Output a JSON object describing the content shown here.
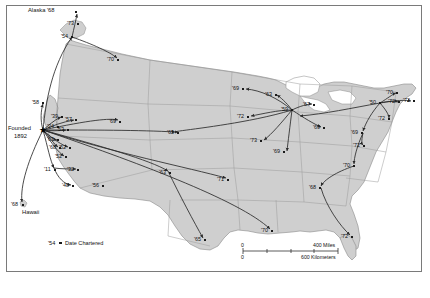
{
  "figure": {
    "type": "map",
    "title": "",
    "frame": {
      "border_color": "#7a7a7a",
      "background": "#ffffff"
    },
    "land_fill": "#cfcfcf",
    "state_border": "#9a9a9a",
    "coast_color": "#8a8a8a",
    "route_color": "#2b2b2b"
  },
  "legend": {
    "sample_year": "'54",
    "marker": "●",
    "label": "Date Chartered"
  },
  "scale_bar": {
    "miles": {
      "zero": "0",
      "max": "400 Miles"
    },
    "kilometers": {
      "zero": "0",
      "max": "600 Kilometers"
    }
  },
  "origin": {
    "name_line1": "Founded",
    "name_line2": "1892",
    "marker": "★"
  },
  "place_labels": [
    {
      "text": "Alaska '68"
    },
    {
      "text": "Hawaii"
    }
  ],
  "chart_data": {
    "type": "map",
    "title": "Date Chartered",
    "value_label": "Date Chartered",
    "series_name": "chapters",
    "points": [
      {
        "label": "Alaska '68",
        "year": "'68",
        "x": 76,
        "y": 12,
        "region": "Alaska"
      },
      {
        "label": "'73",
        "year": "'73",
        "x": 78,
        "y": 24,
        "region": "Washington-north"
      },
      {
        "label": "'54",
        "year": "'54",
        "x": 72,
        "y": 37,
        "region": "Washington"
      },
      {
        "label": "'70",
        "year": "'70",
        "x": 118,
        "y": 60,
        "region": "Montana"
      },
      {
        "label": "'58",
        "year": "'58",
        "x": 43,
        "y": 103,
        "region": "Northern-California"
      },
      {
        "label": "'39",
        "year": "'39",
        "x": 62,
        "y": 117,
        "region": "Bay-Area"
      },
      {
        "label": "'57",
        "year": "'57",
        "x": 76,
        "y": 120,
        "region": "Nevada"
      },
      {
        "label": "'24",
        "year": "'24",
        "x": 58,
        "y": 127,
        "region": "Bay-Area-2"
      },
      {
        "label": "'53",
        "year": "'53",
        "x": 68,
        "y": 130,
        "region": "Central-California"
      },
      {
        "label": "'63",
        "year": "'63",
        "x": 58,
        "y": 140,
        "region": "California-coast"
      },
      {
        "label": "'68",
        "year": "'68",
        "x": 60,
        "y": 148,
        "region": "California-coast-2"
      },
      {
        "label": "'52",
        "year": "'52",
        "x": 70,
        "y": 148,
        "region": "Southern-California"
      },
      {
        "label": "'52",
        "year": "'52",
        "x": 66,
        "y": 157,
        "region": "Southern-California-2"
      },
      {
        "label": "'11",
        "year": "'11",
        "x": 55,
        "y": 170,
        "region": "Los-Angeles"
      },
      {
        "label": "'32",
        "year": "'32",
        "x": 78,
        "y": 170,
        "region": "Los-Angeles-2"
      },
      {
        "label": "'48",
        "year": "'48",
        "x": 73,
        "y": 186,
        "region": "San-Diego"
      },
      {
        "label": "'56",
        "year": "'56",
        "x": 103,
        "y": 186,
        "region": "Arizona"
      },
      {
        "label": "'69",
        "year": "'69",
        "x": 120,
        "y": 122,
        "region": "Utah"
      },
      {
        "label": "'65",
        "year": "'65",
        "x": 178,
        "y": 133,
        "region": "Colorado"
      },
      {
        "label": "'63",
        "year": "'63",
        "x": 170,
        "y": 173,
        "region": "New-Mexico"
      },
      {
        "label": "'65",
        "year": "'65",
        "x": 205,
        "y": 240,
        "region": "Texas-south"
      },
      {
        "label": "'71",
        "year": "'71",
        "x": 228,
        "y": 180,
        "region": "Oklahoma"
      },
      {
        "label": "'69",
        "year": "'69",
        "x": 243,
        "y": 89,
        "region": "North-Dakota"
      },
      {
        "label": "'63",
        "year": "'63",
        "x": 276,
        "y": 95,
        "region": "Minnesota"
      },
      {
        "label": "'59",
        "year": "'59",
        "x": 292,
        "y": 110,
        "region": "Chicago-hub"
      },
      {
        "label": "'67",
        "year": "'67",
        "x": 314,
        "y": 105,
        "region": "Michigan"
      },
      {
        "label": "'72",
        "year": "'72",
        "x": 248,
        "y": 117,
        "region": "Nebraska"
      },
      {
        "label": "'73",
        "year": "'73",
        "x": 261,
        "y": 141,
        "region": "Missouri"
      },
      {
        "label": "'69",
        "year": "'69",
        "x": 324,
        "y": 128,
        "region": "Ohio"
      },
      {
        "label": "'69",
        "year": "'69",
        "x": 284,
        "y": 152,
        "region": "Kentucky"
      },
      {
        "label": "'50",
        "year": "'50",
        "x": 380,
        "y": 103,
        "region": "New-York"
      },
      {
        "label": "'70",
        "year": "'70",
        "x": 397,
        "y": 93,
        "region": "New-England"
      },
      {
        "label": "'72",
        "year": "'72",
        "x": 399,
        "y": 102,
        "region": "New-England-2"
      },
      {
        "label": "'72",
        "year": "'72",
        "x": 414,
        "y": 101,
        "region": "Massachusetts"
      },
      {
        "label": "'72",
        "year": "'72",
        "x": 389,
        "y": 119,
        "region": "New-Jersey"
      },
      {
        "label": "'69",
        "year": "'69",
        "x": 362,
        "y": 133,
        "region": "Maryland"
      },
      {
        "label": "'72",
        "year": "'72",
        "x": 364,
        "y": 146,
        "region": "Virginia"
      },
      {
        "label": "'70",
        "year": "'70",
        "x": 354,
        "y": 166,
        "region": "North-Carolina"
      },
      {
        "label": "'68",
        "year": "'68",
        "x": 320,
        "y": 188,
        "region": "Georgia"
      },
      {
        "label": "'72",
        "year": "'72",
        "x": 352,
        "y": 237,
        "region": "Florida"
      },
      {
        "label": "'70",
        "year": "'70",
        "x": 272,
        "y": 231,
        "region": "Louisiana"
      },
      {
        "label": "'68",
        "year": "'68",
        "x": 23,
        "y": 205,
        "region": "Hawaii"
      }
    ]
  }
}
